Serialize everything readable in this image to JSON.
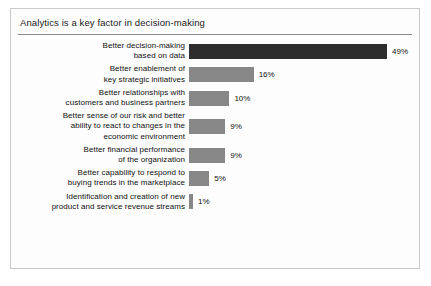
{
  "chart_data": {
    "type": "bar",
    "orientation": "horizontal",
    "title": "Analytics is a key factor in decision-making",
    "xlabel": "",
    "ylabel": "",
    "grid": false,
    "legend": null,
    "xlim": [
      0,
      49
    ],
    "value_suffix": "%",
    "categories": [
      "Better decision-making based on data",
      "Better enablement of key strategic initiatives",
      "Better relationships with customers and business partners",
      "Better sense of our risk and better ability to react to changes in the economic environment",
      "Better financial performance of the organization",
      "Better capability to respond to buying trends in the marketplace",
      "Identification and creation of new product and service revenue streams"
    ],
    "values": [
      49,
      16,
      10,
      9,
      9,
      5,
      1
    ],
    "value_labels": [
      "49%",
      "16%",
      "10%",
      "9%",
      "9%",
      "5%",
      "1%"
    ],
    "colors": [
      "#2d2d2d",
      "#878787",
      "#878787",
      "#878787",
      "#878787",
      "#878787",
      "#878787"
    ],
    "bars": [
      {
        "label_lines": [
          "Better decision-making",
          "based on data"
        ],
        "value": 49,
        "value_label": "49%",
        "color": "#2d2d2d",
        "highlight": true
      },
      {
        "label_lines": [
          "Better enablement of",
          "key strategic initiatives"
        ],
        "value": 16,
        "value_label": "16%",
        "color": "#878787",
        "highlight": false
      },
      {
        "label_lines": [
          "Better relationships with",
          "customers and business partners"
        ],
        "value": 10,
        "value_label": "10%",
        "color": "#878787",
        "highlight": false
      },
      {
        "label_lines": [
          "Better sense of our risk and better",
          "ability to react to changes in the",
          "economic environment"
        ],
        "value": 9,
        "value_label": "9%",
        "color": "#878787",
        "highlight": false
      },
      {
        "label_lines": [
          "Better financial performance",
          "of the organization"
        ],
        "value": 9,
        "value_label": "9%",
        "color": "#878787",
        "highlight": false
      },
      {
        "label_lines": [
          "Better capability to respond to",
          "buying trends in the marketplace"
        ],
        "value": 5,
        "value_label": "5%",
        "color": "#878787",
        "highlight": false
      },
      {
        "label_lines": [
          "Identification and creation of new",
          "product and service revenue streams"
        ],
        "value": 1,
        "value_label": "1%",
        "color": "#878787",
        "highlight": false
      }
    ]
  },
  "panel": {
    "background_color": "#fdfdfd",
    "border_color": "#c9c9c9",
    "rule_color": "#8a8a8a"
  }
}
